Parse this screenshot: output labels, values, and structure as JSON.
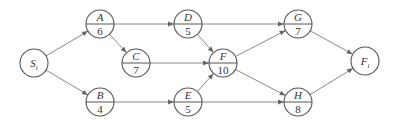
{
  "diagram": {
    "type": "activity-network",
    "nodes": [
      {
        "id": "S",
        "label": "S",
        "sub": "i",
        "x": 34,
        "y": 63,
        "split": false
      },
      {
        "id": "A",
        "label": "A",
        "value": "6",
        "x": 100,
        "y": 24,
        "split": true
      },
      {
        "id": "B",
        "label": "B",
        "value": "4",
        "x": 100,
        "y": 102,
        "split": true
      },
      {
        "id": "C",
        "label": "C",
        "value": "7",
        "x": 136,
        "y": 63,
        "split": true
      },
      {
        "id": "D",
        "label": "D",
        "value": "5",
        "x": 188,
        "y": 24,
        "split": true
      },
      {
        "id": "E",
        "label": "E",
        "value": "5",
        "x": 188,
        "y": 102,
        "split": true
      },
      {
        "id": "F",
        "label": "F",
        "value": "10",
        "x": 223,
        "y": 63,
        "split": true
      },
      {
        "id": "G",
        "label": "G",
        "value": "7",
        "x": 298,
        "y": 24,
        "split": true
      },
      {
        "id": "H",
        "label": "H",
        "value": "8",
        "x": 298,
        "y": 102,
        "split": true
      },
      {
        "id": "Fi",
        "label": "F",
        "sub": "i",
        "x": 365,
        "y": 61,
        "split": false
      }
    ],
    "edges": [
      [
        "S",
        "A"
      ],
      [
        "S",
        "B"
      ],
      [
        "A",
        "D"
      ],
      [
        "A",
        "C"
      ],
      [
        "C",
        "F"
      ],
      [
        "D",
        "F"
      ],
      [
        "D",
        "G"
      ],
      [
        "B",
        "E"
      ],
      [
        "E",
        "F"
      ],
      [
        "E",
        "H"
      ],
      [
        "F",
        "G"
      ],
      [
        "F",
        "H"
      ],
      [
        "G",
        "Fi"
      ],
      [
        "H",
        "Fi"
      ]
    ],
    "colors": {
      "stroke": "#555555",
      "edge": "#888888",
      "text": "#333333"
    }
  }
}
